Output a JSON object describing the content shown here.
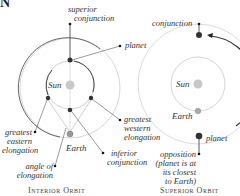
{
  "heading": "N",
  "left_diagram": {
    "labels": {
      "superior_conjunction": "superior\nconjunction",
      "superior_conjunction_1": "superior",
      "superior_conjunction_2": "conjunction",
      "planet": "planet",
      "sun": "Sun",
      "earth": "Earth",
      "greatest_western_1": "greatest",
      "greatest_western_2": "western",
      "greatest_western_3": "elongation",
      "greatest_eastern_1": "greatest",
      "greatest_eastern_2": "eastern",
      "greatest_eastern_3": "elongation",
      "angle_1": "angle of",
      "angle_2": "elongation",
      "inferior_1": "inferior",
      "inferior_2": "conjunction"
    },
    "caption": "Interior Orbit"
  },
  "right_diagram": {
    "labels": {
      "conjunction": "conjunction",
      "sun": "Sun",
      "earth": "Earth",
      "planet": "planet",
      "opposition_1": "opposition",
      "opposition_2": "(planet is at",
      "opposition_3": "its closest",
      "opposition_4": "to Earth)"
    },
    "caption": "Superior Orbit"
  },
  "colors": {
    "sun": "#c8c8c8",
    "orbit": "#bdbdbd",
    "planet": "#333333",
    "arrow": "#222222"
  }
}
